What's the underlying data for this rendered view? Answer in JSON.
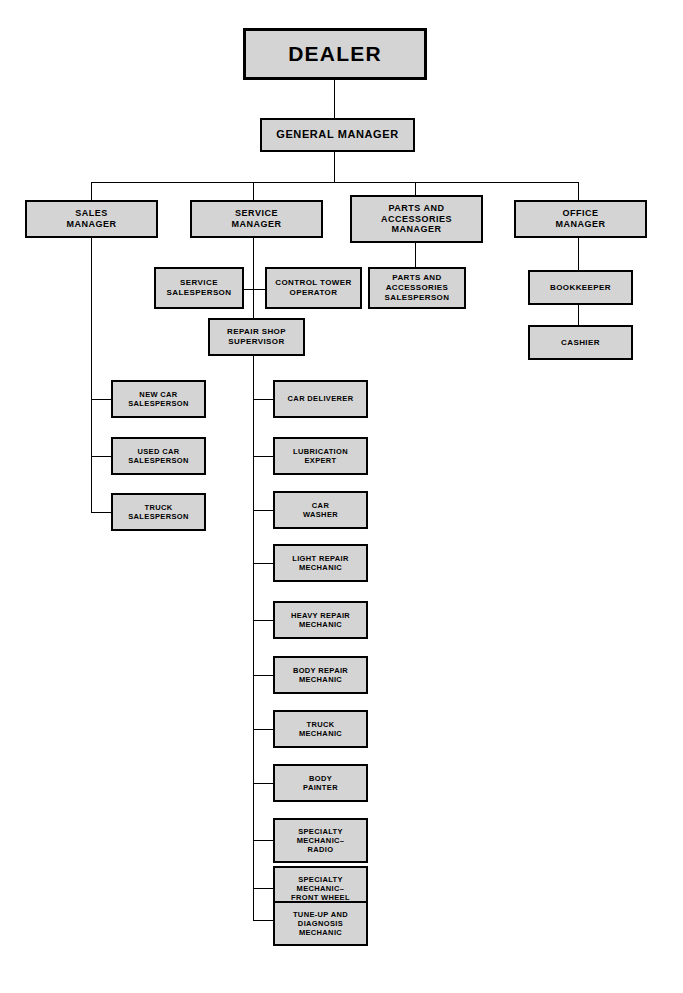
{
  "chart_title": "Automobile Dealership Organization Chart",
  "nodes": {
    "dealer": "DEALER",
    "general_manager": "GENERAL MANAGER",
    "sales_manager": "SALES\nMANAGER",
    "service_manager": "SERVICE\nMANAGER",
    "parts_manager": "PARTS AND\nACCESSORIES\nMANAGER",
    "office_manager": "OFFICE\nMANAGER",
    "service_salesperson": "SERVICE\nSALESPERSON",
    "control_tower_operator": "CONTROL TOWER\nOPERATOR",
    "parts_salesperson": "PARTS AND\nACCESSORIES\nSALESPERSON",
    "bookkeeper": "BOOKKEEPER",
    "cashier": "CASHIER",
    "repair_shop_supervisor": "REPAIR SHOP\nSUPERVISOR",
    "new_car_salesperson": "NEW CAR\nSALESPERSON",
    "used_car_salesperson": "USED CAR\nSALESPERSON",
    "truck_salesperson": "TRUCK\nSALESPERSON",
    "car_deliverer": "CAR DELIVERER",
    "lubrication_expert": "LUBRICATION\nEXPERT",
    "car_washer": "CAR\nWASHER",
    "light_repair_mechanic": "LIGHT REPAIR\nMECHANIC",
    "heavy_repair_mechanic": "HEAVY REPAIR\nMECHANIC",
    "body_repair_mechanic": "BODY REPAIR\nMECHANIC",
    "truck_mechanic": "TRUCK\nMECHANIC",
    "body_painter": "BODY\nPAINTER",
    "specialty_mechanic_radio": "SPECIALTY\nMECHANIC–\nRADIO",
    "specialty_mechanic_front_wheel": "SPECIALTY\nMECHANIC–\nFRONT WHEEL",
    "tuneup_diagnosis_mechanic": "TUNE-UP AND\nDIAGNOSIS\nMECHANIC"
  },
  "colors": {
    "box_fill": "#d4d4d4",
    "box_border": "#000000",
    "connector": "#000000",
    "background": "#ffffff",
    "text": "#000000"
  },
  "chart_data": {
    "type": "diagram",
    "diagram_kind": "organization-chart",
    "hierarchy": [
      {
        "id": "dealer",
        "label": "DEALER",
        "children": [
          {
            "id": "general_manager",
            "label": "GENERAL MANAGER",
            "children": [
              {
                "id": "sales_manager",
                "label": "SALES MANAGER",
                "children": [
                  {
                    "id": "new_car_salesperson",
                    "label": "NEW CAR SALESPERSON"
                  },
                  {
                    "id": "used_car_salesperson",
                    "label": "USED CAR SALESPERSON"
                  },
                  {
                    "id": "truck_salesperson",
                    "label": "TRUCK SALESPERSON"
                  }
                ]
              },
              {
                "id": "service_manager",
                "label": "SERVICE MANAGER",
                "children": [
                  {
                    "id": "service_salesperson",
                    "label": "SERVICE SALESPERSON"
                  },
                  {
                    "id": "control_tower_operator",
                    "label": "CONTROL TOWER OPERATOR"
                  },
                  {
                    "id": "repair_shop_supervisor",
                    "label": "REPAIR SHOP SUPERVISOR",
                    "children": [
                      {
                        "id": "car_deliverer",
                        "label": "CAR DELIVERER"
                      },
                      {
                        "id": "lubrication_expert",
                        "label": "LUBRICATION EXPERT"
                      },
                      {
                        "id": "car_washer",
                        "label": "CAR WASHER"
                      },
                      {
                        "id": "light_repair_mechanic",
                        "label": "LIGHT REPAIR MECHANIC"
                      },
                      {
                        "id": "heavy_repair_mechanic",
                        "label": "HEAVY REPAIR MECHANIC"
                      },
                      {
                        "id": "body_repair_mechanic",
                        "label": "BODY REPAIR MECHANIC"
                      },
                      {
                        "id": "truck_mechanic",
                        "label": "TRUCK MECHANIC"
                      },
                      {
                        "id": "body_painter",
                        "label": "BODY PAINTER"
                      },
                      {
                        "id": "specialty_mechanic_radio",
                        "label": "SPECIALTY MECHANIC– RADIO"
                      },
                      {
                        "id": "specialty_mechanic_front_wheel",
                        "label": "SPECIALTY MECHANIC– FRONT WHEEL"
                      },
                      {
                        "id": "tuneup_diagnosis_mechanic",
                        "label": "TUNE-UP AND DIAGNOSIS MECHANIC"
                      }
                    ]
                  }
                ]
              },
              {
                "id": "parts_manager",
                "label": "PARTS AND ACCESSORIES MANAGER",
                "children": [
                  {
                    "id": "parts_salesperson",
                    "label": "PARTS AND ACCESSORIES SALESPERSON"
                  }
                ]
              },
              {
                "id": "office_manager",
                "label": "OFFICE MANAGER",
                "children": [
                  {
                    "id": "bookkeeper",
                    "label": "BOOKKEEPER",
                    "children": [
                      {
                        "id": "cashier",
                        "label": "CASHIER"
                      }
                    ]
                  }
                ]
              }
            ]
          }
        ]
      }
    ],
    "node_count": 26,
    "depth": 5
  }
}
